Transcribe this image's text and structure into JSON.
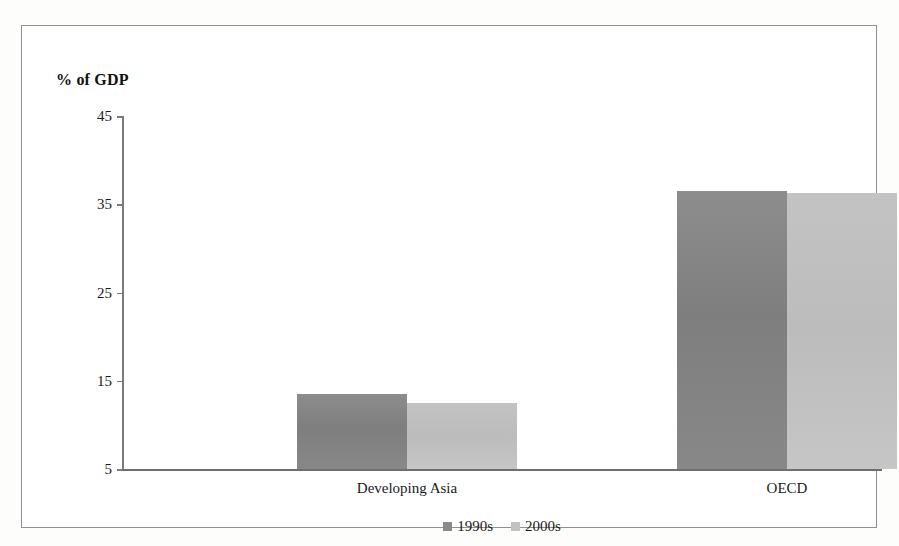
{
  "figure": {
    "axis_title": "% of GDP",
    "frame_color": "#8f8f8f",
    "background": "#ffffff"
  },
  "chart_data": {
    "type": "bar",
    "title": "",
    "subtitle": "",
    "xlabel": "",
    "ylabel": "% of GDP",
    "categories": [
      "Developing Asia",
      "OECD"
    ],
    "series": [
      {
        "name": "1990s",
        "color": "#8a8a8a",
        "values": [
          13.5,
          36.5
        ]
      },
      {
        "name": "2000s",
        "color": "#c2c2c2",
        "values": [
          12.5,
          36.3
        ]
      }
    ],
    "ylim": [
      5,
      45
    ],
    "yticks": [
      45,
      35,
      25,
      15,
      5
    ],
    "ytick_labels": [
      "45",
      "35",
      "25",
      "15",
      "5"
    ],
    "grid": false,
    "legend_position": "bottom",
    "legend_entries": [
      "1990s",
      "2000s"
    ]
  }
}
